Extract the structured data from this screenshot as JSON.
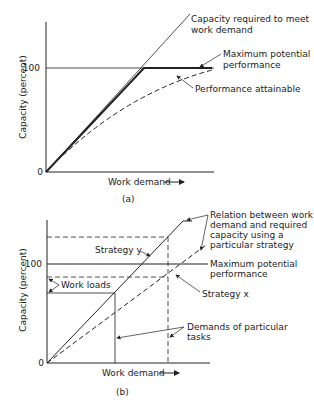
{
  "figure_a": {
    "caption": "(a)",
    "y_axis_label": "Capacity (percent)",
    "x_axis_label": "Work demand",
    "y_ticks": [
      "0",
      "100"
    ],
    "annotations": {
      "capacity_required_1": "Capacity required to meet",
      "capacity_required_2": "work demand",
      "max_potential_1": "Maximum potential",
      "max_potential_2": "performance",
      "performance_attainable": "Performance attainable"
    }
  },
  "figure_b": {
    "caption": "(b)",
    "y_axis_label": "Capacity (percent)",
    "x_axis_label": "Work demand",
    "y_ticks": [
      "0",
      "100"
    ],
    "annotations": {
      "relation_1": "Relation between work",
      "relation_2": "demand and required",
      "relation_3": "capacity using a",
      "relation_4": "particular strategy",
      "strategy_y": "Strategy y",
      "strategy_x": "Strategy x",
      "max_potential_1": "Maximum potential",
      "max_potential_2": "performance",
      "work_loads": "Work loads",
      "demands_1": "Demands of particular",
      "demands_2": "tasks"
    }
  },
  "colors": {
    "ink": "#222222",
    "background": "#ffffff"
  }
}
